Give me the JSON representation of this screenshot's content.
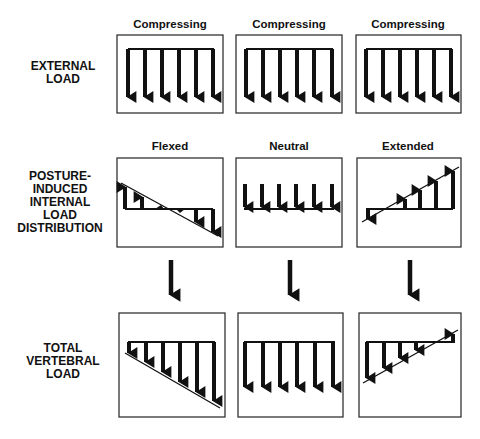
{
  "row_labels": {
    "external": [
      "EXTERNAL",
      "LOAD"
    ],
    "internal": [
      "POSTURE-",
      "INDUCED",
      "INTERNAL",
      "LOAD",
      "DISTRIBUTION"
    ],
    "total": [
      "TOTAL",
      "VERTEBRAL",
      "LOAD"
    ]
  },
  "external_load": {
    "columns": [
      {
        "title": "Compressing"
      },
      {
        "title": "Compressing"
      },
      {
        "title": "Compressing"
      }
    ]
  },
  "internal_load": {
    "columns": [
      {
        "title": "Flexed"
      },
      {
        "title": "Neutral"
      },
      {
        "title": "Extended"
      }
    ]
  },
  "colors": {
    "ink": "#111111",
    "background": "#ffffff",
    "box_border": "#333333"
  }
}
